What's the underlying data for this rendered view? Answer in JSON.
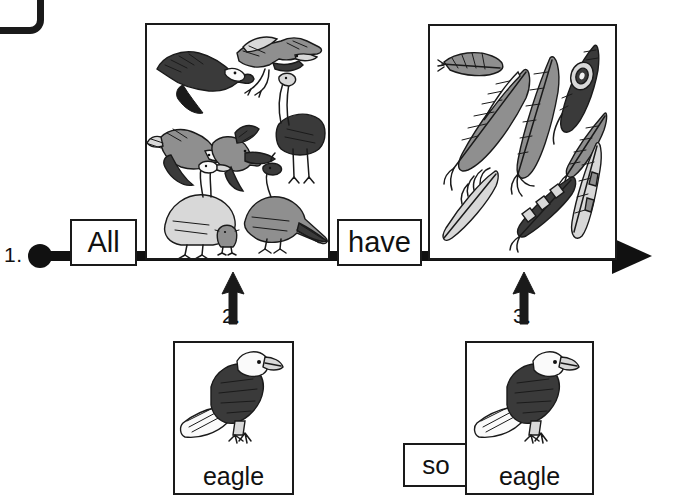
{
  "worksheet": {
    "type": "sentence-strip-diagram",
    "corner_logo": "rounded-square-logo-fragment"
  },
  "timeline": {
    "name": "sentence-timeline",
    "start_marker": "filled-dot",
    "end_marker": "arrowhead-right",
    "steps": [
      {
        "number": "1.",
        "name": "step-1-start"
      },
      {
        "number": "2.",
        "name": "step-2-subject"
      },
      {
        "number": "3.",
        "name": "step-3-object"
      }
    ]
  },
  "words": [
    {
      "id": "all",
      "text": "All",
      "name": "word-box-all"
    },
    {
      "id": "have",
      "text": "have",
      "name": "word-box-have"
    },
    {
      "id": "so",
      "text": "so",
      "name": "word-box-so"
    }
  ],
  "panels": [
    {
      "id": "birds",
      "name": "picture-panel-birds",
      "subject": "birds",
      "count": 8,
      "items": [
        "eagle",
        "heron",
        "ostrich",
        "woodpecker",
        "songbird",
        "goose",
        "pheasant",
        "chick"
      ]
    },
    {
      "id": "feathers",
      "name": "picture-panel-feathers",
      "subject": "feathers",
      "count": 8,
      "items": [
        "small-feather",
        "striped-feather",
        "long-feather",
        "peacock-feather",
        "short-feather",
        "downy-feather",
        "barred-feather",
        "narrow-feather"
      ]
    }
  ],
  "cards": [
    {
      "id": "eagle-left",
      "caption": "eagle",
      "art": "bald-eagle",
      "name": "vocabulary-card-eagle-left"
    },
    {
      "id": "eagle-right",
      "caption": "eagle",
      "art": "bald-eagle",
      "name": "vocabulary-card-eagle-right"
    }
  ],
  "colors": {
    "ink": "#1a1a1a",
    "paper": "#ffffff",
    "shade_dark": "#3a3a3a",
    "shade_mid": "#8f8f8f",
    "shade_light": "#d8d8d8"
  }
}
